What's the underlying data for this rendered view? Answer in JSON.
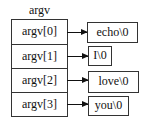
{
  "diagram": {
    "title": "argv",
    "cells": [
      {
        "label": "argv[0]",
        "target": "echo\\0"
      },
      {
        "label": "argv[1]",
        "target": "I\\0"
      },
      {
        "label": "argv[2]",
        "target": "love\\0"
      },
      {
        "label": "argv[3]",
        "target": "you\\0"
      }
    ]
  }
}
